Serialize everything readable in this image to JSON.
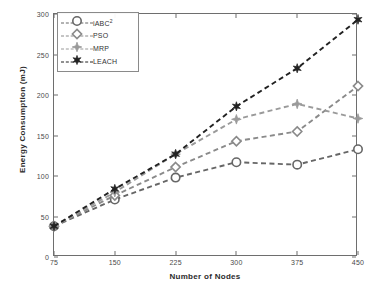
{
  "chart_data": {
    "type": "line",
    "title": "",
    "xlabel": "Number of Nodes",
    "ylabel": "Energy Consumption (mJ)",
    "x": [
      75,
      150,
      225,
      300,
      375,
      450
    ],
    "xticklabels": [
      "75",
      "150",
      "225",
      "300",
      "375",
      "450"
    ],
    "yticklabels": [
      "0",
      "50",
      "100",
      "150",
      "200",
      "250",
      "300"
    ],
    "yticks": [
      0,
      50,
      100,
      150,
      200,
      250,
      300
    ],
    "xlim": [
      75,
      450
    ],
    "ylim": [
      0,
      300
    ],
    "grid": false,
    "legend_position": "upper left",
    "series": [
      {
        "name": "iABC²",
        "label_base": "iABC",
        "label_sup": "2",
        "marker": "circle",
        "color": "#666666",
        "linestyle": "dashed",
        "values": [
          38,
          71,
          98,
          117,
          114,
          133
        ]
      },
      {
        "name": "PSO",
        "label_base": "PSO",
        "label_sup": "",
        "marker": "diamond",
        "color": "#8a8a8a",
        "linestyle": "dashed",
        "values": [
          38,
          76,
          111,
          143,
          155,
          211
        ]
      },
      {
        "name": "MRP",
        "label_base": "MRP",
        "label_sup": "",
        "marker": "small-diamond",
        "color": "#9a9a9a",
        "linestyle": "dashed",
        "values": [
          38,
          80,
          127,
          170,
          189,
          171
        ]
      },
      {
        "name": "LEACH",
        "label_base": "LEACH",
        "label_sup": "",
        "marker": "star",
        "color": "#222222",
        "linestyle": "dashed",
        "values": [
          38,
          84,
          127,
          186,
          233,
          293
        ]
      }
    ]
  },
  "axes": {
    "frame_color": "#6e6e6e",
    "tick_label_color": "#4a4a4a",
    "axis_title_color": "#2b2b2b"
  }
}
